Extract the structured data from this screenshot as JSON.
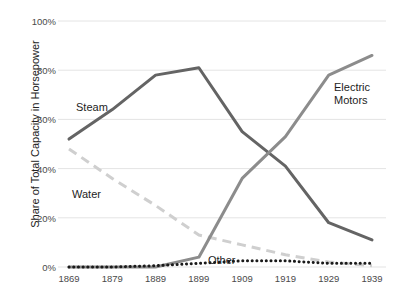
{
  "chart_data": {
    "type": "line",
    "title": "",
    "xlabel": "",
    "ylabel": "Share of Total Capacity in Horsepower",
    "x": [
      1869,
      1879,
      1889,
      1899,
      1909,
      1919,
      1929,
      1939
    ],
    "xtick_labels": [
      "1869",
      "1879",
      "1889",
      "1899",
      "1909",
      "1919",
      "1929",
      "1939"
    ],
    "ytick_labels": [
      "0%",
      "20%",
      "40%",
      "60%",
      "80%",
      "100%"
    ],
    "ytick_values": [
      0,
      20,
      40,
      60,
      80,
      100
    ],
    "ylim": [
      0,
      100
    ],
    "xlim": [
      1869,
      1939
    ],
    "grid": "horizontal",
    "legend": "inline-annotations",
    "series": [
      {
        "name": "Steam",
        "label": "Steam",
        "style": "solid",
        "color": "#646464",
        "width": 3,
        "values": [
          52,
          64,
          78,
          81,
          55,
          41,
          18,
          11
        ]
      },
      {
        "name": "Water",
        "label": "Water",
        "style": "dashed",
        "color": "#cfcfcf",
        "width": 3,
        "values": [
          48,
          36,
          25,
          13,
          9,
          5,
          2,
          0.5
        ]
      },
      {
        "name": "Electric Motors",
        "label": "Electric\nMotors",
        "label_line1": "Electric",
        "label_line2": "Motors",
        "style": "solid",
        "color": "#8c8c8c",
        "width": 3,
        "values": [
          0,
          0,
          0,
          4,
          36,
          53,
          78,
          86
        ]
      },
      {
        "name": "Other",
        "label": "Other",
        "style": "dotted",
        "color": "#1a1a1a",
        "width": 3,
        "values": [
          0,
          0,
          0.5,
          1.5,
          2.5,
          2.5,
          1.5,
          1.5
        ]
      }
    ],
    "annotations": [
      {
        "text": "Steam",
        "x_px": 76,
        "y_px": 101
      },
      {
        "text": "Water",
        "x_px": 72,
        "y_px": 188
      },
      {
        "text": "Electric",
        "x_px": 334,
        "y_px": 81
      },
      {
        "text": "Motors",
        "x_px": 334,
        "y_px": 94
      },
      {
        "text": "Other",
        "x_px": 208,
        "y_px": 254
      }
    ]
  },
  "colors": {
    "background": "#ffffff",
    "gridline": "#e4e4e4",
    "axis_text": "#4a4a4a",
    "title_text": "#222222",
    "steam": "#646464",
    "water": "#cfcfcf",
    "electric": "#8c8c8c",
    "other": "#1a1a1a"
  }
}
